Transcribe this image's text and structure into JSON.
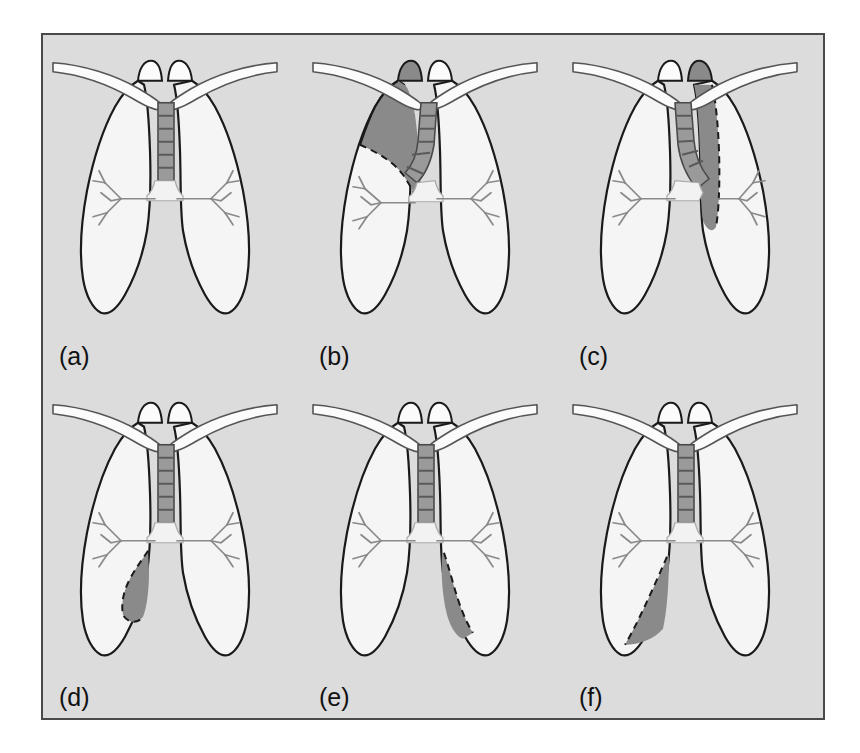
{
  "figure": {
    "type": "medical-illustration-grid",
    "rows": 2,
    "columns": 3,
    "background_color": "#dcdcdc",
    "border_color": "#4a4a4a",
    "page_background": "#ffffff"
  },
  "colors": {
    "panel_background": "#dcdcdc",
    "lung_fill": "#f5f5f5",
    "outline": "#1a1a1a",
    "shaded_region": "#8a8a8a",
    "trachea_fill": "#9a9a9a",
    "trachea_band": "#6e6e6e",
    "bone_fill": "#fbfbfb",
    "airway_stroke": "#7a7a7a",
    "label_color": "#111111"
  },
  "panels": [
    {
      "id": "a",
      "label": "(a)",
      "caption_letter": "a",
      "condition": "normal",
      "shaded": false,
      "shaded_region": "none",
      "trachea_deviation": "none"
    },
    {
      "id": "b",
      "label": "(b)",
      "caption_letter": "b",
      "condition": "right-upper-lobe-collapse",
      "shaded": true,
      "shaded_region": "right upper lobe, apical and medial, bounded below by dashed fissure line",
      "trachea_deviation": "toward right"
    },
    {
      "id": "c",
      "label": "(c)",
      "caption_letter": "c",
      "condition": "left-upper-lobe-collapse",
      "shaded": true,
      "shaded_region": "left upper lobe, vertical medial band from apex to hilum, dashed lateral boundary",
      "trachea_deviation": "toward left"
    },
    {
      "id": "d",
      "label": "(d)",
      "caption_letter": "d",
      "condition": "right-middle-lobe-collapse",
      "shaded": true,
      "shaded_region": "right middle lobe, medial mid-to-lower zone, dashed lateral boundary",
      "trachea_deviation": "none"
    },
    {
      "id": "e",
      "label": "(e)",
      "caption_letter": "e",
      "condition": "left-lower-lobe-collapse",
      "shaded": true,
      "shaded_region": "left lower lobe, medial basal triangular region, dashed lateral boundary",
      "trachea_deviation": "none"
    },
    {
      "id": "f",
      "label": "(f)",
      "caption_letter": "f",
      "condition": "right-lower-lobe-collapse",
      "shaded": true,
      "shaded_region": "right lower lobe, oblique basal triangular region, dashed superolateral boundary",
      "trachea_deviation": "none"
    }
  ],
  "anatomy_parts": [
    "trachea",
    "carina",
    "right main bronchus",
    "left main bronchus",
    "bronchial tree branches",
    "right lung",
    "left lung",
    "right clavicle",
    "left clavicle",
    "first rib"
  ]
}
